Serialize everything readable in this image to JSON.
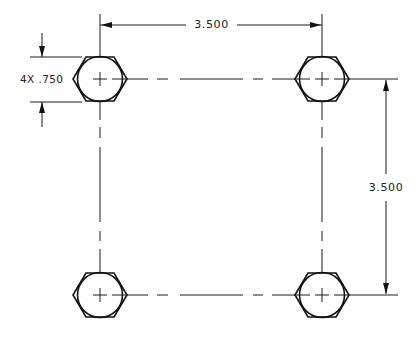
{
  "drawing": {
    "type": "bolt-hole-pattern",
    "colors": {
      "line": "#111111",
      "background": "#ffffff",
      "text": "#222222"
    },
    "holes": [
      {
        "id": "top-left",
        "cx": 100,
        "cy": 79
      },
      {
        "id": "top-right",
        "cx": 322,
        "cy": 79
      },
      {
        "id": "bottom-left",
        "cx": 100,
        "cy": 295
      },
      {
        "id": "bottom-right",
        "cx": 322,
        "cy": 295
      }
    ],
    "dimensions": {
      "horizontal_spacing": {
        "label": "3.500"
      },
      "vertical_spacing": {
        "label": "3.500"
      },
      "hole_size": {
        "label": "4X .750"
      }
    }
  }
}
